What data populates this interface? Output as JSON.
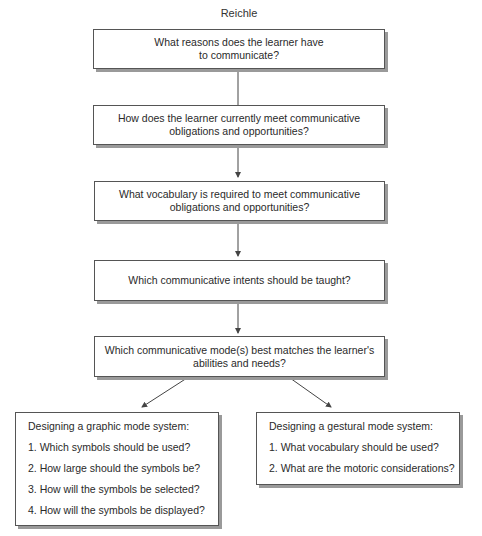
{
  "title": "Reichle",
  "flow": [
    {
      "id": "reasons",
      "lines": [
        "What reasons does the learner have",
        "to communicate?"
      ]
    },
    {
      "id": "current",
      "lines": [
        "How does the learner currently meet communicative",
        "obligations and opportunities?"
      ]
    },
    {
      "id": "vocabulary",
      "lines": [
        "What vocabulary is required to meet communicative",
        "obligations and opportunities?"
      ]
    },
    {
      "id": "intents",
      "lines": [
        "Which communicative intents should be taught?"
      ]
    },
    {
      "id": "mode",
      "lines": [
        "Which communicative mode(s) best matches the learner's",
        "abilities and needs?"
      ]
    }
  ],
  "branches": {
    "graphic": {
      "heading": "Designing a graphic mode system:",
      "items": [
        "1. Which symbols should be used?",
        "2. How large should the symbols be?",
        "3. How will the symbols be selected?",
        "4. How will the symbols be displayed?"
      ]
    },
    "gestural": {
      "heading": "Designing a gestural mode system:",
      "items": [
        "1. What vocabulary should be used?",
        "2. What are the motoric considerations?"
      ]
    }
  },
  "colors": {
    "border": "#555555",
    "shadow": "#9a9a9a",
    "text": "#2a2a2a",
    "arrow": "#444444"
  }
}
